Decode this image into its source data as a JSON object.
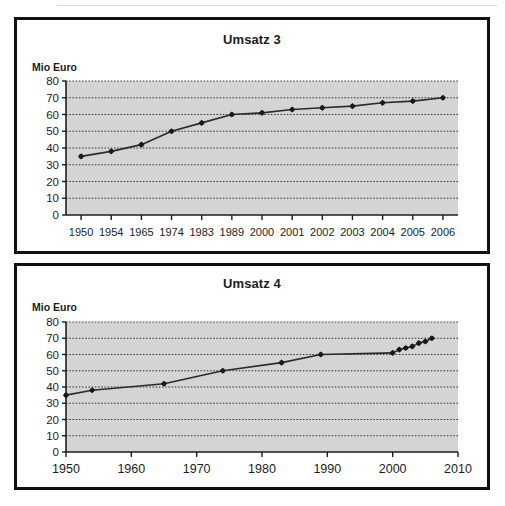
{
  "page": {
    "background_color": "#ffffff",
    "caption": ""
  },
  "style": {
    "plot_fill": "#d4d4d4",
    "gridline_color": "#3a3a3a",
    "axis_color": "#1c1c1c",
    "series_color": "#2b2b2b",
    "marker_color": "#1a1a1a",
    "panel_border_color": "#111111",
    "text_color": "#1c1c1c"
  },
  "charts": [
    {
      "id": "umsatz-3",
      "title": "Umsatz 3",
      "axis_unit_label": "Mio Euro",
      "x_axis_type": "category",
      "chart_data": {
        "type": "line",
        "title": "Umsatz 3",
        "xlabel": "",
        "ylabel": "Mio Euro",
        "ylim": [
          0,
          80
        ],
        "ytick_step": 10,
        "yticks": [
          "0",
          "10",
          "20",
          "30",
          "40",
          "50",
          "60",
          "70",
          "80"
        ],
        "grid": true,
        "legend": "none",
        "categories": [
          "1950",
          "1954",
          "1965",
          "1974",
          "1983",
          "1989",
          "2000",
          "2001",
          "2002",
          "2003",
          "2004",
          "2005",
          "2006"
        ],
        "values": [
          35,
          38,
          42,
          50,
          55,
          60,
          61,
          63,
          64,
          65,
          67,
          68,
          70
        ]
      }
    },
    {
      "id": "umsatz-4",
      "title": "Umsatz 4",
      "axis_unit_label": "Mio Euro",
      "x_axis_type": "linear-time",
      "chart_data": {
        "type": "line",
        "title": "Umsatz 4",
        "xlabel": "",
        "ylabel": "Mio Euro",
        "ylim": [
          0,
          80
        ],
        "ytick_step": 10,
        "yticks": [
          "0",
          "10",
          "20",
          "30",
          "40",
          "50",
          "60",
          "70",
          "80"
        ],
        "xlim": [
          1950,
          2010
        ],
        "xtick_step": 10,
        "xticks": [
          "1950",
          "1960",
          "1970",
          "1980",
          "1990",
          "2000",
          "2010"
        ],
        "grid": true,
        "legend": "none",
        "x": [
          1950,
          1954,
          1965,
          1974,
          1983,
          1989,
          2000,
          2001,
          2002,
          2003,
          2004,
          2005,
          2006
        ],
        "values": [
          35,
          38,
          42,
          50,
          55,
          60,
          61,
          63,
          64,
          65,
          67,
          68,
          70
        ]
      }
    }
  ]
}
